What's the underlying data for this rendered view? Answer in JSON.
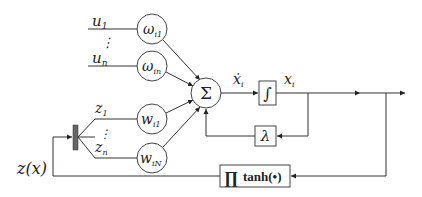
{
  "inputs": {
    "u1": {
      "base": "u",
      "sub": "1"
    },
    "un": {
      "base": "u",
      "sub": "n"
    },
    "z1": {
      "base": "z",
      "sub": "1"
    },
    "zn": {
      "base": "z",
      "sub": "n"
    },
    "dots": "⋮"
  },
  "weights": {
    "omega_i1": {
      "base": "ω",
      "sub": "i1"
    },
    "omega_in": {
      "base": "ω",
      "sub": "in"
    },
    "w_i1": {
      "base": "w",
      "sub": "i1"
    },
    "w_iN": {
      "base": "w",
      "sub": "iN"
    }
  },
  "blocks": {
    "sum": "Σ",
    "integrator": "∫",
    "lambda": "λ",
    "product": "∏",
    "tanh": "tanh(•)"
  },
  "signals": {
    "xdot": {
      "base": "ẋ",
      "sub": "i"
    },
    "x": {
      "base": "x",
      "sub": "i"
    },
    "zx": "z(x)"
  }
}
